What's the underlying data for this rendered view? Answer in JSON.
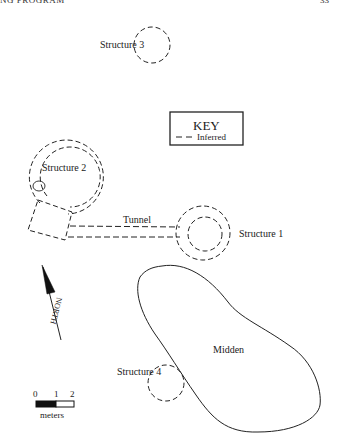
{
  "header": {
    "running_head": "NG PROGRAM",
    "page_number": "33"
  },
  "key": {
    "title": "KEY",
    "entries": [
      {
        "symbol": "dashed-line",
        "label": "Inferred"
      }
    ]
  },
  "features": {
    "structure_1": {
      "label": "Structure 1"
    },
    "structure_2": {
      "label": "Structure 2"
    },
    "structure_3": {
      "label": "Structure 3"
    },
    "structure_4": {
      "label": "Structure 4"
    },
    "tunnel": {
      "label": "Tunnel"
    },
    "midden": {
      "label": "Midden"
    }
  },
  "north_arrow": {
    "label": "NORTH"
  },
  "scale_bar": {
    "ticks": [
      "0",
      "1",
      "2"
    ],
    "unit": "meters"
  }
}
